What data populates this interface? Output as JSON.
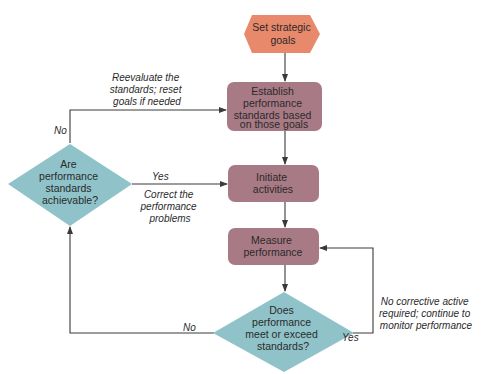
{
  "colors": {
    "start_fill": "#e8896c",
    "process_fill": "#a87a86",
    "decision_fill": "#8fc3c9",
    "edge": "#3a3a3a"
  },
  "nodes": {
    "set_goals": {
      "lines": [
        "Set strategic",
        "goals"
      ],
      "shape": "hexagon"
    },
    "establish": {
      "lines": [
        "Establish",
        "performance",
        "standards based",
        "on those goals"
      ],
      "shape": "rounded-rect"
    },
    "initiate": {
      "lines": [
        "Initiate",
        "activities"
      ],
      "shape": "rounded-rect"
    },
    "measure": {
      "lines": [
        "Measure",
        "performance"
      ],
      "shape": "rounded-rect"
    },
    "meet_standards": {
      "lines": [
        "Does",
        "performance",
        "meet or exceed",
        "standards?"
      ],
      "shape": "diamond"
    },
    "achievable": {
      "lines": [
        "Are",
        "performance",
        "standards",
        "achievable?"
      ],
      "shape": "diamond"
    }
  },
  "edge_labels": {
    "reevaluate": [
      "Reevaluate the",
      "standards; reset",
      "goals if needed"
    ],
    "no_top": "No",
    "yes_left": "Yes",
    "correct": [
      "Correct the",
      "performance",
      "problems"
    ],
    "no_corrective": [
      "No corrective active",
      "required; continue to",
      "monitor performance"
    ],
    "yes_right": "Yes",
    "no_bottom": "No"
  }
}
